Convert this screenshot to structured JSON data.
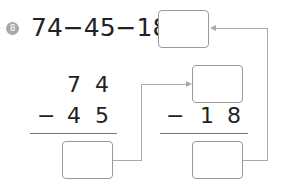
{
  "problem": {
    "number": "8",
    "equation": "74−45−18="
  },
  "column_left": {
    "top_digits": [
      "7",
      "4"
    ],
    "operator": "−",
    "bottom_digits": [
      "4",
      "5"
    ]
  },
  "column_right": {
    "operator": "−",
    "bottom_digits": [
      "1",
      "8"
    ]
  },
  "colors": {
    "badge": "#a8a8a8",
    "box_border": "#9a9a9a",
    "connector": "#aaaaaa"
  }
}
